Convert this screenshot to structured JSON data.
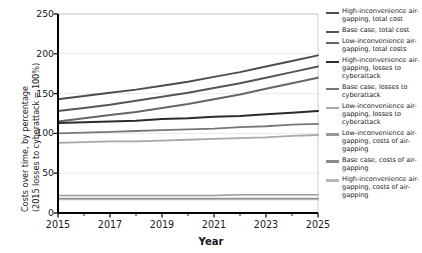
{
  "chart_data": {
    "type": "line",
    "title": "",
    "xlabel": "Year",
    "ylabel_line1": "Costs over time, by percentage",
    "ylabel_line2": "(2015 losses to cyberattack = 100%)",
    "x": [
      2015,
      2016,
      2017,
      2018,
      2019,
      2020,
      2021,
      2022,
      2023,
      2024,
      2025
    ],
    "xticks": [
      2015,
      2017,
      2019,
      2021,
      2023,
      2025
    ],
    "yticks": [
      0,
      50,
      100,
      150,
      200,
      250
    ],
    "xlim": [
      2015,
      2025
    ],
    "ylim": [
      0,
      250
    ],
    "grid": true,
    "legend_position": "right",
    "series": [
      {
        "name": "High-inconvenience air-gapping, total cost",
        "color": "#4d4d4d",
        "width": 2.0,
        "values": [
          143,
          147,
          151,
          155,
          160,
          165,
          171,
          177,
          184,
          191,
          198
        ]
      },
      {
        "name": "Base case, total cost",
        "color": "#555555",
        "width": 2.0,
        "values": [
          128,
          132,
          136,
          141,
          146,
          151,
          157,
          163,
          170,
          177,
          184
        ]
      },
      {
        "name": "Low-inconvenience air-gapping, total costs",
        "color": "#666666",
        "width": 2.0,
        "values": [
          115,
          119,
          123,
          127,
          132,
          137,
          143,
          149,
          156,
          163,
          170
        ]
      },
      {
        "name": "High-inconvenience air-gapping, losses to cyberattack",
        "color": "#2b2b2b",
        "width": 2.0,
        "values": [
          113,
          114,
          115,
          116,
          118,
          119,
          121,
          122,
          124,
          126,
          128
        ]
      },
      {
        "name": "Base case, losses to cyberattack",
        "color": "#777777",
        "width": 1.8,
        "values": [
          100,
          101,
          102,
          103,
          104,
          105,
          106,
          108,
          109,
          111,
          112
        ]
      },
      {
        "name": "Low-inconvenience air-gapping, losses to cyberattack",
        "color": "#a8a8a8",
        "width": 1.8,
        "values": [
          88,
          89,
          90,
          90,
          91,
          92,
          93,
          94,
          95,
          97,
          98
        ]
      },
      {
        "name": "Low-inconvenience air-gapping, costs of air-gapping",
        "color": "#999999",
        "width": 1.6,
        "values": [
          22,
          22,
          22,
          22,
          22,
          22,
          22,
          23,
          23,
          23,
          23
        ]
      },
      {
        "name": "Base case, costs of air-gapping",
        "color": "#8a8a8a",
        "width": 1.6,
        "values": [
          18,
          18,
          18,
          18,
          18,
          18,
          18,
          18,
          18,
          18,
          18
        ]
      },
      {
        "name": "High-inconvenience air-gapping, costs of air-gapping",
        "color": "#b5b5b5",
        "width": 1.6,
        "values": [
          17,
          17,
          17,
          17,
          17,
          17,
          17,
          17,
          17,
          17,
          17
        ]
      }
    ],
    "legend": [
      {
        "label": "High-inconvenience air-gapping, total cost",
        "color": "#4d4d4d"
      },
      {
        "label": "Base case, total cost",
        "color": "#555555"
      },
      {
        "label": "Low-inconvenience air-gapping, total costs",
        "color": "#666666"
      },
      {
        "label": "High-inconvenience air-gapping, losses to cyberattack",
        "color": "#2b2b2b"
      },
      {
        "label": "Base case, losses to cyberattack",
        "color": "#777777"
      },
      {
        "label": "Low-inconvenience air-gapping, losses to cyberattack",
        "color": "#a8a8a8"
      },
      {
        "label": "Low-inconvenience air-gapping, costs of air-gapping",
        "color": "#999999"
      },
      {
        "label": "Base case, costs of air-gapping",
        "color": "#8a8a8a"
      },
      {
        "label": "High-inconvenience air-gapping, costs of air-gapping",
        "color": "#b5b5b5"
      }
    ]
  }
}
